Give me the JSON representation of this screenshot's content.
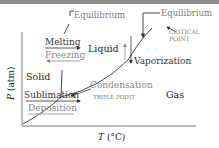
{
  "diagram": {
    "axes": {
      "ylabel_var": "P",
      "ylabel_unit": " (atm)",
      "xlabel_var": "T",
      "xlabel_unit": " (°C)"
    },
    "regions": {
      "solid": "Solid",
      "liquid": "Liquid",
      "gas": "Gas"
    },
    "transitions": {
      "melting": "Melting",
      "freezing": "Freezing",
      "vaporization": "Vaporization",
      "condensation": "Condensation",
      "sublimation": "Sublimation",
      "deposition": "Deposition"
    },
    "annotations": {
      "equilibrium_left": "Equilibrium",
      "equilibrium_right": "Equilibrium",
      "critical_point_line1": "CRITICAL",
      "critical_point_line2": "POINT",
      "triple_point": "TRIPLE POINT"
    },
    "colors": {
      "primary_text": "#1a1a1a",
      "secondary_text": "#7a7a7a",
      "axis": "#777777",
      "curve": "#333333",
      "topbar": "#8f8f8f"
    }
  }
}
